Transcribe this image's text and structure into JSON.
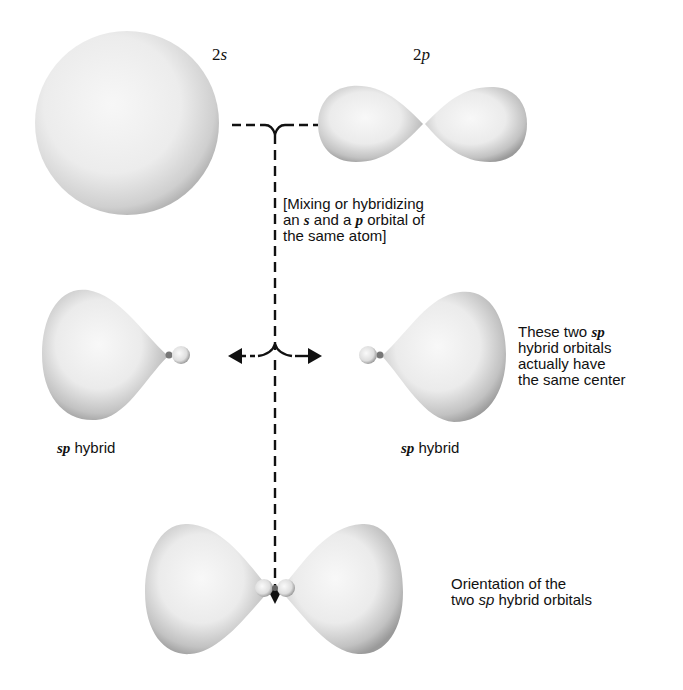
{
  "diagram": {
    "orbitals": {
      "s": {
        "label_num": "2",
        "label_letter": "s"
      },
      "p": {
        "label_num": "2",
        "label_letter": "p"
      }
    },
    "mixing_note": {
      "line1": "[Mixing or hybridizing",
      "line2_pre": "an ",
      "line2_s": "s",
      "line2_mid": " and a ",
      "line2_p": "p",
      "line2_post": " orbital of",
      "line3": "the same atom]"
    },
    "hybrid_left": {
      "sp": "sp",
      "rest": " hybrid"
    },
    "hybrid_right": {
      "sp": "sp",
      "rest": " hybrid"
    },
    "same_center_note": {
      "line1_pre": "These two ",
      "line1_sp": "sp",
      "line2": "hybrid orbitals",
      "line3": "actually have",
      "line4": "the same center"
    },
    "orientation_note": {
      "line1": "Orientation of the",
      "line2_pre": "two ",
      "line2_sp": "sp",
      "line2_post": " hybrid orbitals"
    },
    "colors": {
      "lobe_light": "#f4f4f4",
      "lobe_dark": "#9a9a9a",
      "line": "#111111"
    }
  }
}
